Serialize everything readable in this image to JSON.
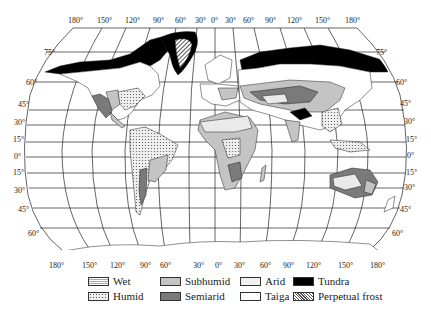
{
  "map": {
    "type": "world climate map",
    "projection": "pseudo-cylindrical (oval graticule)",
    "top_longitude_labels": [
      "180°",
      "150°",
      "120°",
      "90°",
      "60°",
      "30°",
      "0°",
      "30°",
      "60°",
      "90°",
      "120°",
      "150°",
      "180°"
    ],
    "bottom_longitude_labels": [
      "180°",
      "150°",
      "120°",
      "90°",
      "60°",
      "30°",
      "0°",
      "30°",
      "60°",
      "90°",
      "120°",
      "150°",
      "180°"
    ],
    "left_latitude_labels": [
      "75°",
      "60°",
      "45°",
      "30°",
      "15°",
      "0°",
      "15°",
      "30°",
      "45°",
      "60°"
    ],
    "right_latitude_labels": [
      "75°",
      "60°",
      "45°",
      "30°",
      "15°",
      "0°",
      "15°",
      "30°",
      "45°",
      "60°"
    ],
    "colors": {
      "tundra": "#000000",
      "semiarid": "#7a7a7a",
      "subhumid": "#c4c4c4",
      "arid": "#f0f0f0",
      "taiga": "#ffffff",
      "line": "#222222"
    }
  },
  "legend": {
    "items": [
      {
        "key": "wet",
        "label": "Wet",
        "pattern": "fine horizontal hatch"
      },
      {
        "key": "humid",
        "label": "Humid",
        "pattern": "dots"
      },
      {
        "key": "subhumid",
        "label": "Subhumid",
        "pattern": "light gray"
      },
      {
        "key": "semiarid",
        "label": "Semiarid",
        "pattern": "dark gray"
      },
      {
        "key": "arid",
        "label": "Arid",
        "pattern": "light stipple"
      },
      {
        "key": "taiga",
        "label": "Taiga",
        "pattern": "white"
      },
      {
        "key": "tundra",
        "label": "Tundra",
        "pattern": "black"
      },
      {
        "key": "perpetual_frost",
        "label": "Perpetual frost",
        "pattern": "diagonal hatch"
      }
    ]
  }
}
